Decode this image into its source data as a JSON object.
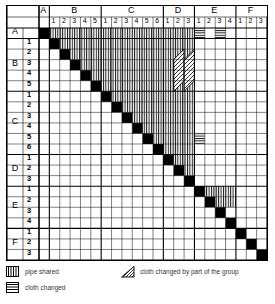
{
  "figure": {
    "n_rows": 22,
    "n_cols": 22
  },
  "axis": {
    "groups": [
      {
        "label": "A",
        "subs": [
          ""
        ]
      },
      {
        "label": "B",
        "subs": [
          "1",
          "2",
          "3",
          "4",
          "5"
        ]
      },
      {
        "label": "C",
        "subs": [
          "1",
          "2",
          "3",
          "4",
          "5",
          "6"
        ]
      },
      {
        "label": "D",
        "subs": [
          "1",
          "2",
          "3"
        ]
      },
      {
        "label": "E",
        "subs": [
          "1",
          "2",
          "3",
          "4"
        ]
      },
      {
        "label": "F",
        "subs": [
          "1",
          "2",
          "3"
        ]
      }
    ],
    "cells": [
      "A",
      "B1",
      "B2",
      "B3",
      "B4",
      "B5",
      "C1",
      "C2",
      "C3",
      "C4",
      "C5",
      "C6",
      "D1",
      "D2",
      "D3",
      "E1",
      "E2",
      "E3",
      "E4",
      "F1",
      "F2",
      "F3"
    ]
  },
  "legend": {
    "items": [
      {
        "icon": "vertical-hatch-swatch",
        "label": "pipe shared"
      },
      {
        "icon": "horizontal-hatch-swatch",
        "label": "cloth changed"
      },
      {
        "icon": "diagonal-hatch-triangle",
        "label": "cloth changed by part of the group"
      }
    ]
  },
  "colors": {
    "ink": "#000000",
    "paper": "#ffffff",
    "hatch": "#000000"
  },
  "chart_data": {
    "type": "heatmap",
    "xlabel": "",
    "ylabel": "",
    "categories": [
      "A",
      "B1",
      "B2",
      "B3",
      "B4",
      "B5",
      "C1",
      "C2",
      "C3",
      "C4",
      "C5",
      "C6",
      "D1",
      "D2",
      "D3",
      "E1",
      "E2",
      "E3",
      "E4",
      "F1",
      "F2",
      "F3"
    ],
    "value_legend": {
      "diagonal": "self (solid black)",
      "vertical": "pipe shared",
      "horizontal": "cloth changed",
      "diag-hatch": "cloth changed by part of the group",
      "empty": "no relation"
    },
    "cells": [
      {
        "row": "A",
        "col_start": "B1",
        "col_end": "D3",
        "value": "vertical"
      },
      {
        "row": "A",
        "col_start": "E1",
        "col_end": "E1",
        "value": "horizontal"
      },
      {
        "row": "A",
        "col_start": "E3",
        "col_end": "E3",
        "value": "horizontal"
      },
      {
        "row": "B1",
        "col_start": "B2",
        "col_end": "D3",
        "value": "vertical"
      },
      {
        "row": "B2",
        "col_start": "B3",
        "col_end": "D3",
        "value": "vertical"
      },
      {
        "row": "B3",
        "col_start": "B4",
        "col_end": "D3",
        "value": "vertical"
      },
      {
        "row": "B4",
        "col_start": "B5",
        "col_end": "D3",
        "value": "vertical"
      },
      {
        "row": "B5",
        "col_start": "C1",
        "col_end": "D3",
        "value": "vertical"
      },
      {
        "row": "C1",
        "col_start": "C2",
        "col_end": "D3",
        "value": "vertical"
      },
      {
        "row": "C2",
        "col_start": "C3",
        "col_end": "D3",
        "value": "vertical"
      },
      {
        "row": "C3",
        "col_start": "C4",
        "col_end": "D3",
        "value": "vertical"
      },
      {
        "row": "C4",
        "col_start": "C5",
        "col_end": "D3",
        "value": "vertical"
      },
      {
        "row": "C5",
        "col_start": "C6",
        "col_end": "D3",
        "value": "vertical"
      },
      {
        "row": "C5",
        "col_start": "E1",
        "col_end": "E1",
        "value": "horizontal"
      },
      {
        "row": "C6",
        "col_start": "D1",
        "col_end": "D3",
        "value": "vertical"
      },
      {
        "row": "D1",
        "col_start": "D2",
        "col_end": "D3",
        "value": "vertical"
      },
      {
        "row": "D2",
        "col_start": "D3",
        "col_end": "D3",
        "value": "vertical"
      },
      {
        "row": "E1",
        "col_start": "E2",
        "col_end": "E4",
        "value": "vertical"
      },
      {
        "row": "E2",
        "col_start": "E3",
        "col_end": "E4",
        "value": "vertical"
      },
      {
        "row": "B2",
        "col_start": "D2",
        "col_end": "D2",
        "value": "diag-hatch-start"
      },
      {
        "row": "B5",
        "col_start": "D2",
        "col_end": "D2",
        "value": "diag-hatch-end"
      },
      {
        "row": "B2",
        "col_start": "D3",
        "col_end": "D3",
        "value": "diag-hatch-start"
      },
      {
        "row": "B5",
        "col_start": "D3",
        "col_end": "D3",
        "value": "diag-hatch-end"
      }
    ]
  }
}
